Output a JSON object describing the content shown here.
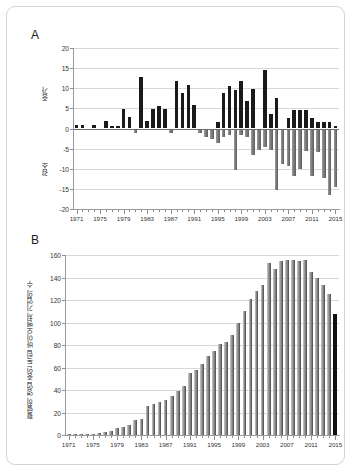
{
  "figure": {
    "background_color": "#ffffff",
    "border_color": "#d2d2d2"
  },
  "panels": [
    {
      "letter": "A"
    },
    {
      "letter": "B"
    }
  ],
  "chart_data": [
    {
      "type": "bar",
      "panel": "A",
      "title": "",
      "xlabel": "",
      "ylabel_top": "증가",
      "ylabel_bottom": "감소",
      "ylim": [
        -20,
        20
      ],
      "yticks": [
        20,
        15,
        10,
        5,
        0,
        -5,
        -10,
        -15,
        -20
      ],
      "ytick_labels": [
        "20",
        "15",
        "10",
        "5",
        "0",
        "-5",
        "-10",
        "-15",
        "-20"
      ],
      "xticks": [
        1971,
        1975,
        1979,
        1983,
        1987,
        1991,
        1995,
        1999,
        2003,
        2007,
        2011,
        2015
      ],
      "xtick_labels": [
        "1971",
        "1975",
        "1979",
        "1983",
        "1987",
        "1991",
        "1995",
        "1999",
        "2003",
        "2007",
        "2011",
        "2015"
      ],
      "xlim": [
        1970.4,
        2015.6
      ],
      "grid": true,
      "legend": "none",
      "positive_color": "#1a1a1a",
      "negative_color": "#7b7b7b",
      "categories": [
        1971,
        1972,
        1973,
        1974,
        1975,
        1976,
        1977,
        1978,
        1979,
        1980,
        1981,
        1982,
        1983,
        1984,
        1985,
        1986,
        1987,
        1988,
        1989,
        1990,
        1991,
        1992,
        1993,
        1994,
        1995,
        1996,
        1997,
        1998,
        1999,
        2000,
        2001,
        2002,
        2003,
        2004,
        2005,
        2006,
        2007,
        2008,
        2009,
        2010,
        2011,
        2012,
        2013,
        2014,
        2015
      ],
      "values": [
        0.8,
        0.8,
        0,
        0.9,
        0,
        1.9,
        0.7,
        0.7,
        4.9,
        2.9,
        -1.2,
        12.8,
        1.8,
        4.9,
        5.7,
        4.9,
        -1.1,
        11.8,
        8.8,
        10.7,
        5.8,
        -1.1,
        -1.1,
        -1.1,
        1.7,
        8.9,
        10.6,
        9.6,
        11.7,
        6.8,
        9.7,
        -1.3,
        14.6,
        3.6,
        7.6,
        -1.2,
        2.7,
        4.6,
        4.7,
        4.7,
        2.6,
        1.6,
        1.6,
        1.6,
        0.6
      ],
      "negative_overlay": {
        "categories": [
          1992,
          1993,
          1994,
          1995,
          1996,
          1997,
          1998,
          1999,
          2000,
          2001,
          2002,
          2003,
          2004,
          2005,
          2006,
          2007,
          2008,
          2009,
          2010,
          2011,
          2012,
          2013,
          2014,
          2015
        ],
        "values": [
          -1.1,
          -2.1,
          -2.7,
          -3.7,
          -2.2,
          -1.6,
          -10.4,
          -1.7,
          -2.0,
          -6.6,
          -5.3,
          -4.5,
          -5.4,
          -15.4,
          -8.8,
          -9.4,
          -11.8,
          -10.1,
          -5.5,
          -11.8,
          -5.8,
          -12.3,
          -16.5,
          -14.6
        ]
      }
    },
    {
      "type": "bar",
      "panel": "B",
      "title": "",
      "xlabel": "",
      "ylabel": "활발히 영업 중인 독립 바이오벤처 기업의 수",
      "ylim": [
        0,
        160
      ],
      "yticks": [
        160,
        140,
        120,
        100,
        80,
        60,
        40,
        20,
        0
      ],
      "ytick_labels": [
        "160",
        "140",
        "120",
        "100",
        "80",
        "60",
        "40",
        "20",
        "0"
      ],
      "xticks": [
        1971,
        1975,
        1979,
        1983,
        1987,
        1991,
        1995,
        1999,
        2003,
        2007,
        2011,
        2015
      ],
      "xtick_labels": [
        "1971",
        "1975",
        "1979",
        "1983",
        "1987",
        "1991",
        "1995",
        "1999",
        "2003",
        "2007",
        "2011",
        "2015"
      ],
      "xlim": [
        1970.4,
        2015.6
      ],
      "grid": true,
      "legend": "none",
      "bar_color": "#9a9a9a",
      "last_bar_color": "#111111",
      "categories": [
        1971,
        1972,
        1973,
        1974,
        1975,
        1976,
        1977,
        1978,
        1979,
        1980,
        1981,
        1982,
        1983,
        1984,
        1985,
        1986,
        1987,
        1988,
        1989,
        1990,
        1991,
        1992,
        1993,
        1994,
        1995,
        1996,
        1997,
        1998,
        1999,
        2000,
        2001,
        2002,
        2003,
        2004,
        2005,
        2006,
        2007,
        2008,
        2009,
        2010,
        2011,
        2012,
        2013,
        2014,
        2015
      ],
      "values": [
        1,
        1,
        1,
        1,
        1,
        2,
        3,
        4,
        6,
        7,
        9,
        13,
        14,
        26,
        28,
        29,
        31,
        35,
        39,
        44,
        55,
        58,
        63,
        70,
        75,
        81,
        83,
        89,
        100,
        110,
        121,
        128,
        133,
        153,
        148,
        155,
        156,
        156,
        155,
        156,
        145,
        140,
        133,
        125,
        108
      ],
      "values_note": "heights read off the 20-unit gridlines",
      "values_corrected": [
        1,
        1,
        1,
        1,
        1,
        2,
        3,
        4,
        6,
        7,
        9,
        13,
        14,
        26,
        28,
        29,
        31,
        35,
        39,
        44,
        55,
        58,
        63,
        70,
        75,
        81,
        83,
        89,
        100,
        110,
        121,
        128,
        133,
        153,
        148,
        155,
        156,
        156,
        155,
        156,
        145,
        140,
        133,
        125,
        108
      ],
      "highlight_index": 44
    }
  ]
}
